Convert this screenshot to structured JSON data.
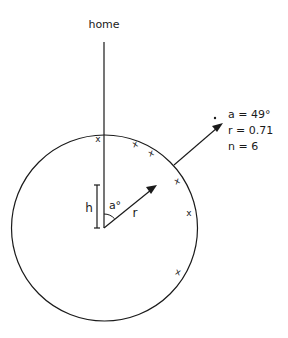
{
  "diagram": {
    "top_label": "home",
    "stats": {
      "angle_line": "a = 49°",
      "r_line": "r = 0.71",
      "n_line": "n = 6"
    },
    "inner_labels": {
      "height": "h",
      "angle": "a°",
      "vector": "r"
    },
    "circle": {
      "cx": 104.5,
      "cy": 228,
      "r": 93
    },
    "home_direction_deg": 0,
    "mean_vector": {
      "angle_deg": 49,
      "length": 0.71
    },
    "observations": {
      "count": 6,
      "marker": "x",
      "positions": [
        {
          "x": 98,
          "y": 139
        },
        {
          "x": 135,
          "y": 144
        },
        {
          "x": 151,
          "y": 153
        },
        {
          "x": 177,
          "y": 181
        },
        {
          "x": 189,
          "y": 213
        },
        {
          "x": 178,
          "y": 272
        }
      ]
    },
    "colors": {
      "ink": "#1a1a1a",
      "background": "#ffffff"
    }
  }
}
